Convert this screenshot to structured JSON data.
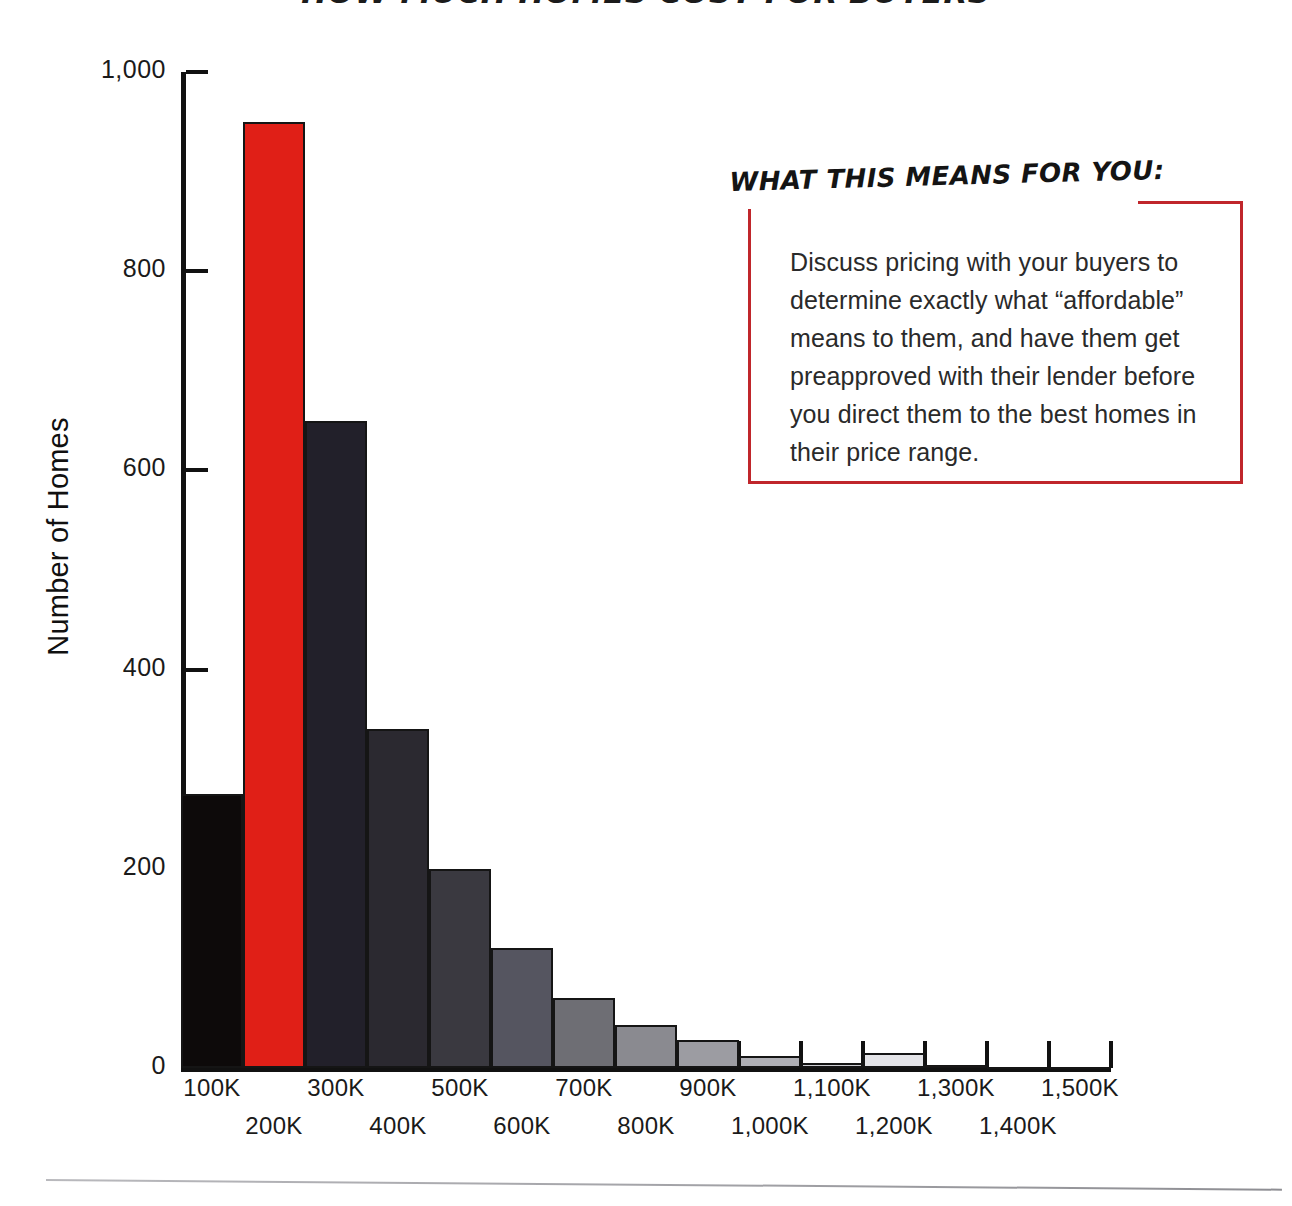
{
  "title": "HOW MUCH HOMES COST FOR BUYERS",
  "axis": {
    "y_label": "Number of Homes",
    "y_ticks": [
      "1,000",
      "800",
      "600",
      "400",
      "200",
      "0"
    ],
    "x_ticks": [
      "100K",
      "200K",
      "300K",
      "400K",
      "500K",
      "600K",
      "700K",
      "800K",
      "900K",
      "1,000K",
      "1,100K",
      "1,200K",
      "1,300K",
      "1,400K",
      "1,500K"
    ]
  },
  "callout": {
    "heading": "WHAT THIS MEANS FOR YOU:",
    "body": "Discuss pricing with your buyers to determine exactly what “affordable” means to them, and have them get preapproved with their lender before you direct them to the best homes in their price range.",
    "accent_color": "#c0262b"
  },
  "chart_data": {
    "type": "bar",
    "title": "HOW MUCH HOMES COST FOR BUYERS",
    "xlabel": "",
    "ylabel": "Number of Homes",
    "ylim": [
      0,
      1000
    ],
    "grid": false,
    "legend": "none",
    "categories": [
      "100K",
      "200K",
      "300K",
      "400K",
      "500K",
      "600K",
      "700K",
      "800K",
      "900K",
      "1,000K",
      "1,100K",
      "1,200K",
      "1,300K",
      "1,400K",
      "1,500K"
    ],
    "values": [
      275,
      950,
      650,
      340,
      200,
      120,
      70,
      43,
      28,
      12,
      5,
      15,
      3,
      1,
      1
    ],
    "bar_colors": [
      "#0d0a0a",
      "#e01f17",
      "#22202a",
      "#2b2930",
      "#3a3940",
      "#555560",
      "#6e6e74",
      "#8a8a90",
      "#9c9ca2",
      "#b0b0b6",
      "#cdcdd2",
      "#e4e4e8",
      "#1a1717",
      "#ffffff",
      "#ffffff"
    ],
    "highlight_index": 1,
    "highlight_color": "#e01f17"
  }
}
